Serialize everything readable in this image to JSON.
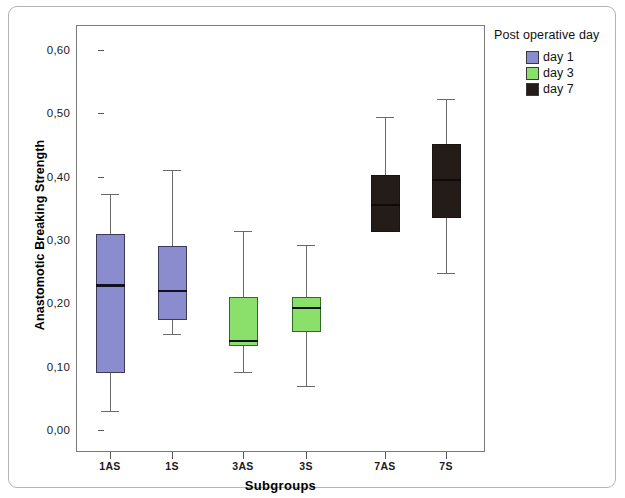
{
  "chart_data": {
    "type": "box",
    "title": "",
    "xlabel": "Subgroups",
    "ylabel": "Anastomotic Breaking Strength",
    "ylim": [
      0.0,
      0.65
    ],
    "y_ticks": [
      "0,00",
      "0,10",
      "0,20",
      "0,30",
      "0,40",
      "0,50",
      "0,60"
    ],
    "y_tick_values": [
      0.0,
      0.1,
      0.2,
      0.3,
      0.4,
      0.5,
      0.6
    ],
    "categories": [
      "1AS",
      "1S",
      "3AS",
      "3S",
      "7AS",
      "7S"
    ],
    "grid": false,
    "legend": {
      "title": "Post operative day",
      "position": "right",
      "entries": [
        {
          "label": "day 1",
          "color": "#8a8ccd"
        },
        {
          "label": "day 3",
          "color": "#8ae06a"
        },
        {
          "label": "day 7",
          "color": "#241c19"
        }
      ]
    },
    "boxes": [
      {
        "category": "1AS",
        "group": "day 1",
        "color": "#8a8ccd",
        "whisker_low": 0.03,
        "q1": 0.09,
        "median": 0.228,
        "q3": 0.31,
        "whisker_high": 0.372
      },
      {
        "category": "1S",
        "group": "day 1",
        "color": "#8a8ccd",
        "whisker_low": 0.151,
        "q1": 0.173,
        "median": 0.219,
        "q3": 0.29,
        "whisker_high": 0.411
      },
      {
        "category": "3AS",
        "group": "day 3",
        "color": "#8ae06a",
        "whisker_low": 0.091,
        "q1": 0.133,
        "median": 0.141,
        "q3": 0.21,
        "whisker_high": 0.314
      },
      {
        "category": "3S",
        "group": "day 3",
        "color": "#8ae06a",
        "whisker_low": 0.07,
        "q1": 0.155,
        "median": 0.193,
        "q3": 0.21,
        "whisker_high": 0.292
      },
      {
        "category": "7AS",
        "group": "day 7",
        "color": "#241c19",
        "whisker_low": 0.312,
        "q1": 0.312,
        "median": 0.355,
        "q3": 0.402,
        "whisker_high": 0.494
      },
      {
        "category": "7S",
        "group": "day 7",
        "color": "#241c19",
        "whisker_low": 0.248,
        "q1": 0.335,
        "median": 0.395,
        "q3": 0.452,
        "whisker_high": 0.523
      }
    ]
  }
}
